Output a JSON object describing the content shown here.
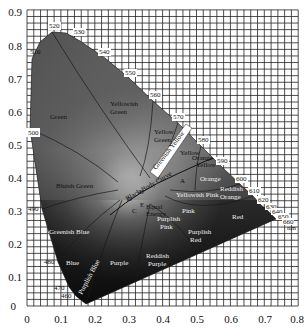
{
  "chart_data": {
    "type": "diagram",
    "xlabel": "",
    "ylabel": "",
    "xlim": [
      0,
      0.8
    ],
    "ylim": [
      0,
      0.9
    ],
    "grid": true,
    "grid_step": 0.02,
    "x_ticks": [
      "0",
      "0.1",
      "0.2",
      "0.3",
      "0.4",
      "0.5",
      "0.6",
      "0.7",
      "0.8"
    ],
    "y_ticks": [
      "0",
      "0.1",
      "0.2",
      "0.3",
      "0.4",
      "0.5",
      "0.6",
      "0.7",
      "0.8",
      "0.9"
    ],
    "spectral_locus": [
      {
        "nm": "460",
        "x": 0.144,
        "y": 0.03
      },
      {
        "nm": "470",
        "x": 0.124,
        "y": 0.058
      },
      {
        "nm": "480",
        "x": 0.091,
        "y": 0.133
      },
      {
        "nm": "490",
        "x": 0.045,
        "y": 0.295
      },
      {
        "nm": "500",
        "x": 0.008,
        "y": 0.538
      },
      {
        "nm": "510",
        "x": 0.014,
        "y": 0.75
      },
      {
        "nm": "520",
        "x": 0.074,
        "y": 0.834
      },
      {
        "nm": "530",
        "x": 0.155,
        "y": 0.806
      },
      {
        "nm": "540",
        "x": 0.23,
        "y": 0.754
      },
      {
        "nm": "550",
        "x": 0.302,
        "y": 0.692
      },
      {
        "nm": "560",
        "x": 0.373,
        "y": 0.624
      },
      {
        "nm": "570",
        "x": 0.444,
        "y": 0.555
      },
      {
        "nm": "580",
        "x": 0.512,
        "y": 0.487
      },
      {
        "nm": "590",
        "x": 0.575,
        "y": 0.424
      },
      {
        "nm": "600",
        "x": 0.627,
        "y": 0.372
      },
      {
        "nm": "610",
        "x": 0.666,
        "y": 0.334
      },
      {
        "nm": "620",
        "x": 0.691,
        "y": 0.308
      },
      {
        "nm": "630",
        "x": 0.708,
        "y": 0.292
      },
      {
        "nm": "640",
        "x": 0.719,
        "y": 0.281
      },
      {
        "nm": "650",
        "x": 0.726,
        "y": 0.274
      },
      {
        "nm": "660",
        "x": 0.73,
        "y": 0.27
      }
    ],
    "wavelength_labels": [
      "460",
      "470",
      "480",
      "490",
      "500",
      "510",
      "520",
      "530",
      "540",
      "550",
      "560",
      "570",
      "580",
      "590",
      "600",
      "610",
      "620",
      "630",
      "640",
      "650",
      "660",
      "nm"
    ],
    "regions": [
      "Green",
      "Yellowish Green",
      "Yellow Green",
      "Greenish Yellow",
      "Yellow",
      "Yellowish Orange",
      "Orange",
      "Reddish Orange",
      "Red",
      "Bluish Green",
      "Greenish Blue",
      "Blue",
      "Purplish Blue",
      "Purple",
      "Reddish Purple",
      "Purplish Pink",
      "Pink",
      "Purplish Red",
      "Yellowish Pink",
      "Equal Energy"
    ],
    "curve_label": "Black Body Curve",
    "illuminant_points": [
      "A",
      "B",
      "C",
      "D",
      "E"
    ]
  },
  "labels": {
    "x_ticks": [
      "0",
      "0.1",
      "0.2",
      "0.3",
      "0.4",
      "0.5",
      "0.6",
      "0.7",
      "0.8"
    ],
    "y_ticks": [
      "0",
      "0.1",
      "0.2",
      "0.3",
      "0.4",
      "0.5",
      "0.6",
      "0.7",
      "0.8",
      "0.9"
    ],
    "wl": {
      "w460": "460",
      "w470": "470",
      "w480": "480",
      "w490": "490",
      "w500": "500",
      "w510": "510",
      "w520": "520",
      "w530": "530",
      "w540": "540",
      "w550": "550",
      "w560": "560",
      "w570": "570",
      "w580": "580",
      "w590": "590",
      "w600": "600",
      "w610": "610",
      "w620": "620",
      "w630": "630",
      "w640": "640",
      "w650": "650",
      "w660": "660",
      "nm": "nm"
    },
    "regions": {
      "green": "Green",
      "yellowish_green_1": "Yellowish",
      "yellowish_green_2": "Green",
      "yellow_green_1": "Yellow",
      "yellow_green_2": "Green",
      "greenish_yellow": "Greenish Yellow",
      "yellow": "Yellow",
      "yellowish_orange_1": "Orange",
      "yellowish_orange_2": "Yellow",
      "orange": "Orange",
      "reddish_orange_1": "Reddish",
      "reddish_orange_2": "Orange",
      "red": "Red",
      "bluish_green": "Bluish Green",
      "greenish_blue": "Greenish Blue",
      "blue": "Blue",
      "purplish_blue": "Purplish Blue",
      "purple": "Purple",
      "reddish_purple_1": "Reddish",
      "reddish_purple_2": "Purple",
      "purplish_pink_1": "Purplish",
      "purplish_pink_2": "Pink",
      "pink": "Pink",
      "purplish_red_1": "Purplish",
      "purplish_red_2": "Red",
      "yellowish_pink": "Yellowish Pink",
      "equal_1": "Equal",
      "equal_2": "Energy",
      "blackbody": "Black Body Curve",
      "pA": "A",
      "pB": "B",
      "pC": "C",
      "pD": "D",
      "pE": "E"
    }
  }
}
